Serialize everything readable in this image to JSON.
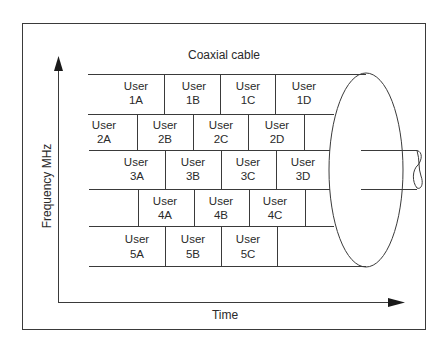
{
  "title": "Coaxial cable",
  "axes": {
    "y_label": "Frequency MHz",
    "x_label": "Time"
  },
  "cells": {
    "r1": [
      {
        "line1": "User",
        "line2": "1A"
      },
      {
        "line1": "User",
        "line2": "1B"
      },
      {
        "line1": "User",
        "line2": "1C"
      },
      {
        "line1": "User",
        "line2": "1D"
      }
    ],
    "r2": [
      {
        "line1": "User",
        "line2": "2A"
      },
      {
        "line1": "User",
        "line2": "2B"
      },
      {
        "line1": "User",
        "line2": "2C"
      },
      {
        "line1": "User",
        "line2": "2D"
      }
    ],
    "r3": [
      {
        "line1": "User",
        "line2": "3A"
      },
      {
        "line1": "User",
        "line2": "3B"
      },
      {
        "line1": "User",
        "line2": "3C"
      },
      {
        "line1": "User",
        "line2": "3D"
      }
    ],
    "r4": [
      {
        "line1": "User",
        "line2": "4A"
      },
      {
        "line1": "User",
        "line2": "4B"
      },
      {
        "line1": "User",
        "line2": "4C"
      }
    ],
    "r5": [
      {
        "line1": "User",
        "line2": "5A"
      },
      {
        "line1": "User",
        "line2": "5B"
      },
      {
        "line1": "User",
        "line2": "5C"
      }
    ]
  }
}
